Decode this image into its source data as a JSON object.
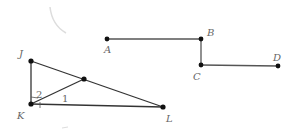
{
  "figure1": {
    "points": {
      "J": {
        "label": "J",
        "x": 31,
        "y": 61
      },
      "K": {
        "label": "K",
        "x": 31,
        "y": 104
      },
      "L": {
        "label": "L",
        "x": 163,
        "y": 107
      },
      "M": {
        "label": "",
        "x": 84,
        "y": 79
      }
    },
    "segments": [
      "JK",
      "JL",
      "KL",
      "KM"
    ],
    "angle_labels": {
      "angle1": "1",
      "angle2": "2"
    }
  },
  "figure2": {
    "points": {
      "A": {
        "label": "A",
        "x": 107,
        "y": 39
      },
      "B": {
        "label": "B",
        "x": 201,
        "y": 39
      },
      "C": {
        "label": "C",
        "x": 201,
        "y": 65
      },
      "D": {
        "label": "D",
        "x": 278,
        "y": 66
      }
    },
    "segments": [
      "AB",
      "BC",
      "CD"
    ]
  }
}
